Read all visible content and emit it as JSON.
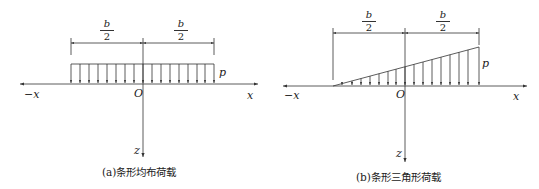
{
  "figure": {
    "panels": [
      {
        "id": "a",
        "caption": "(a)条形均布荷载",
        "load_type": "uniform",
        "labels": {
          "half_width_left_num": "b",
          "half_width_left_den": "2",
          "half_width_right_num": "b",
          "half_width_right_den": "2",
          "load_intensity": "p",
          "origin": "O",
          "neg_x": "−x",
          "pos_x": "x",
          "z_axis": "z"
        }
      },
      {
        "id": "b",
        "caption": "(b)条形三角形荷载",
        "load_type": "triangular",
        "labels": {
          "half_width_left_num": "b",
          "half_width_left_den": "2",
          "half_width_right_num": "b",
          "half_width_right_den": "2",
          "load_intensity": "p",
          "origin": "O",
          "neg_x": "−x",
          "pos_x": "x",
          "z_axis": "z"
        }
      }
    ],
    "colors": {
      "line": "#333333",
      "text": "#222222",
      "background": "#ffffff"
    }
  }
}
